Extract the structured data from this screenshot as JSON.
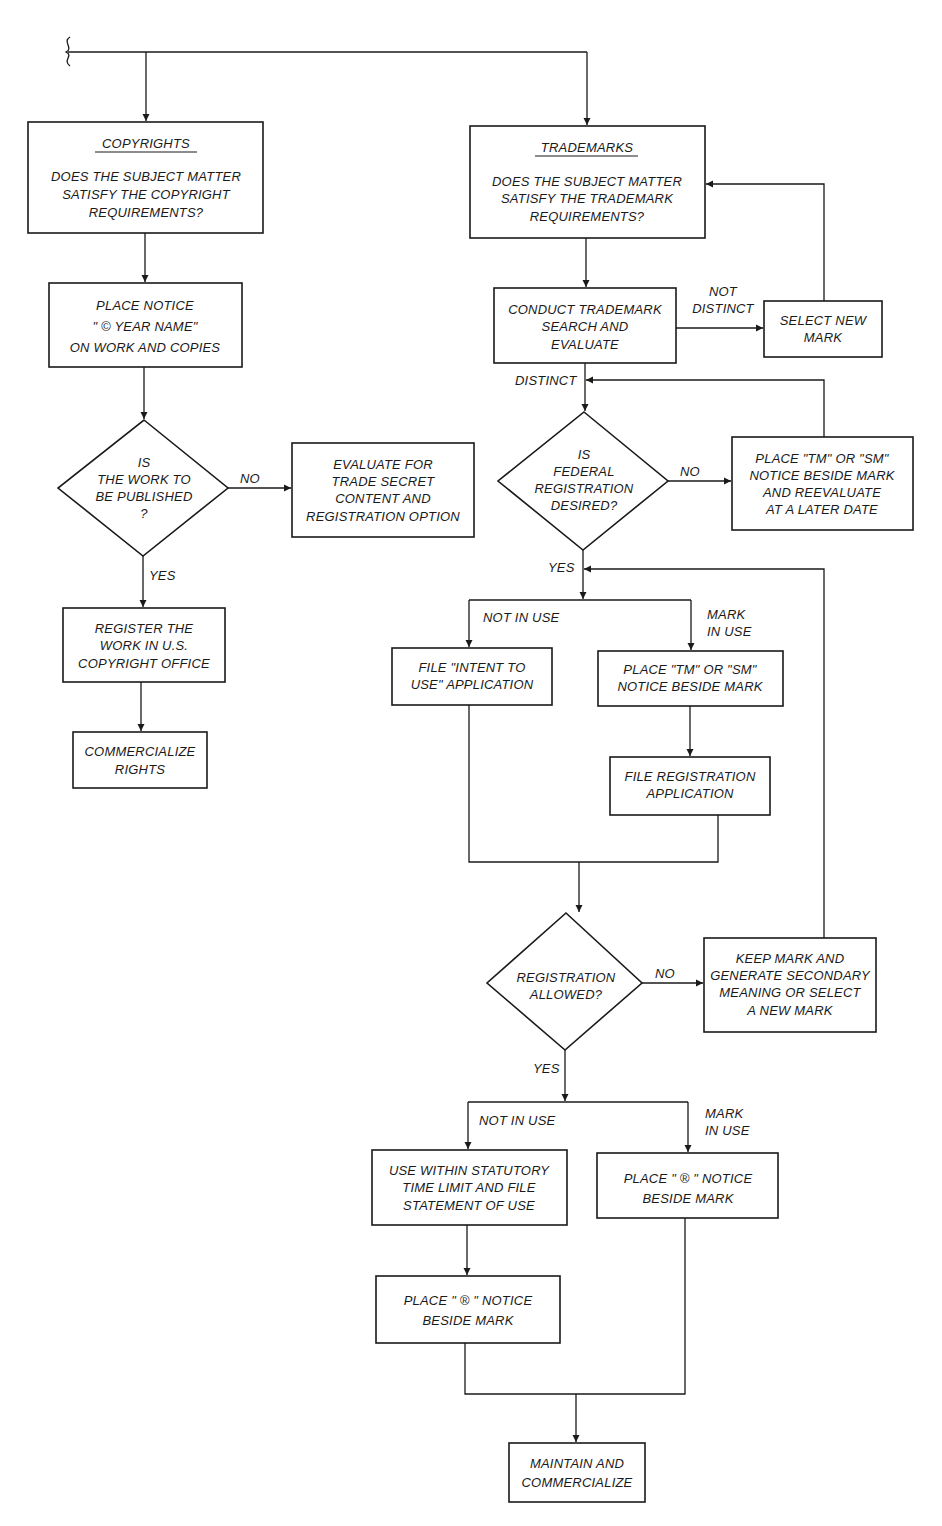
{
  "diagram": {
    "accent_color": "#1a1a1a",
    "background_color": "#ffffff",
    "copyrights": {
      "header": "COPYRIGHTS",
      "question_lines": [
        "DOES THE SUBJECT MATTER",
        "SATISFY THE COPYRIGHT",
        "REQUIREMENTS?"
      ],
      "place_notice_lines": [
        "PLACE NOTICE",
        "\" © YEAR NAME\"",
        "ON WORK AND COPIES"
      ],
      "decision_lines": [
        "IS",
        "THE WORK TO",
        "BE PUBLISHED",
        "?"
      ],
      "no_label": "NO",
      "yes_label": "YES",
      "evaluate_lines": [
        "EVALUATE FOR",
        "TRADE SECRET",
        "CONTENT AND",
        "REGISTRATION OPTION"
      ],
      "register_lines": [
        "REGISTER THE",
        "WORK IN U.S.",
        "COPYRIGHT OFFICE"
      ],
      "commercialize_lines": [
        "COMMERCIALIZE",
        "RIGHTS"
      ]
    },
    "trademarks": {
      "header": "TRADEMARKS",
      "question_lines": [
        "DOES THE SUBJECT MATTER",
        "SATISFY THE TRADEMARK",
        "REQUIREMENTS?"
      ],
      "search_lines": [
        "CONDUCT TRADEMARK",
        "SEARCH AND",
        "EVALUATE"
      ],
      "not_distinct_lines": [
        "NOT",
        "DISTINCT"
      ],
      "select_new_lines": [
        "SELECT NEW",
        "MARK"
      ],
      "distinct_label": "DISTINCT",
      "federal_lines": [
        "IS",
        "FEDERAL",
        "REGISTRATION",
        "DESIRED?"
      ],
      "federal_no_label": "NO",
      "federal_yes_label": "YES",
      "place_tm_later_lines": [
        "PLACE \"TM\" OR \"SM\"",
        "NOTICE BESIDE MARK",
        "AND REEVALUATE",
        "AT A LATER DATE"
      ],
      "not_in_use_label_1": "NOT IN USE",
      "mark_in_use_label_1": [
        "MARK",
        "IN USE"
      ],
      "intent_to_use_lines": [
        "FILE \"INTENT TO",
        "USE\" APPLICATION"
      ],
      "place_tm_lines": [
        "PLACE \"TM\" OR \"SM\"",
        "NOTICE BESIDE MARK"
      ],
      "file_registration_lines": [
        "FILE REGISTRATION",
        "APPLICATION"
      ],
      "allowed_lines": [
        "REGISTRATION",
        "ALLOWED?"
      ],
      "allowed_no_label": "NO",
      "allowed_yes_label": "YES",
      "keep_mark_lines": [
        "KEEP MARK AND",
        "GENERATE SECONDARY",
        "MEANING OR SELECT",
        "A NEW MARK"
      ],
      "not_in_use_label_2": "NOT IN USE",
      "mark_in_use_label_2": [
        "MARK",
        "IN USE"
      ],
      "use_within_lines": [
        "USE WITHIN STATUTORY",
        "TIME LIMIT AND FILE",
        "STATEMENT OF USE"
      ],
      "place_r_right_lines": [
        "PLACE \" ® \" NOTICE",
        "BESIDE MARK"
      ],
      "place_r_left_lines": [
        "PLACE \" ® \" NOTICE",
        "BESIDE MARK"
      ],
      "maintain_lines": [
        "MAINTAIN AND",
        "COMMERCIALIZE"
      ]
    }
  }
}
